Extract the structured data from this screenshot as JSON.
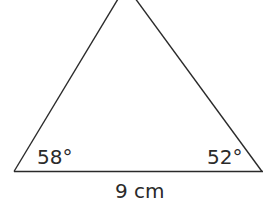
{
  "diagram": {
    "type": "triangle",
    "stroke_color": "#2a2a2a",
    "background": "#ffffff",
    "angles": {
      "bottom_left": "58°",
      "bottom_right": "52°"
    },
    "base_label": "9 cm"
  }
}
